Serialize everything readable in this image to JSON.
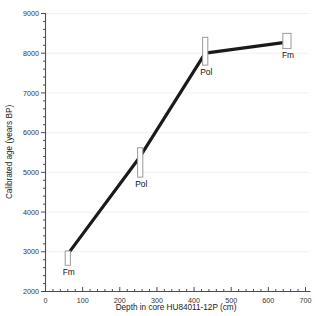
{
  "chart_data": {
    "type": "line",
    "title": "",
    "xlabel": "Depth in core HU84011-12P (cm)",
    "ylabel": "Calibrated age (years BP)",
    "xlim": [
      0,
      700
    ],
    "ylim": [
      2000,
      9000
    ],
    "x_major_step": 100,
    "x_minor_step": 20,
    "y_major_step": 1000,
    "y_minor_step": 200,
    "grid": "horizontal-major-only",
    "legend": "none",
    "x_ticks": [
      "0",
      "100",
      "200",
      "300",
      "400",
      "500",
      "600",
      "700"
    ],
    "y_ticks": [
      "2000",
      "3000",
      "4000",
      "5000",
      "6000",
      "7000",
      "8000",
      "9000"
    ],
    "series": [
      {
        "name": "Age-depth model",
        "line_color": "#1a1a1a",
        "x": [
          60,
          255,
          430,
          650
        ],
        "y": [
          2940,
          5400,
          8000,
          8280
        ]
      }
    ],
    "points": [
      {
        "label": "Fm",
        "depth_cm": 60,
        "age_bp": 2940,
        "age_low": 2660,
        "age_high": 3020,
        "box_width_cm": 14
      },
      {
        "label": "Pol",
        "depth_cm": 255,
        "age_bp": 5400,
        "age_low": 4880,
        "age_high": 5620,
        "box_width_cm": 14
      },
      {
        "label": "Pol",
        "depth_cm": 430,
        "age_bp": 8000,
        "age_low": 7700,
        "age_high": 8400,
        "box_width_cm": 14
      },
      {
        "label": "Fm",
        "depth_cm": 650,
        "age_bp": 8280,
        "age_low": 8120,
        "age_high": 8500,
        "box_width_cm": 22
      }
    ],
    "colors": {
      "line": "#1a1a1a",
      "axis": "#4d4d4d",
      "grid": "#f0f0f0",
      "box_stroke": "#9a9a9a",
      "box_fill": "#ffffff",
      "background": "#ffffff",
      "text": "#1a1a1a"
    }
  }
}
